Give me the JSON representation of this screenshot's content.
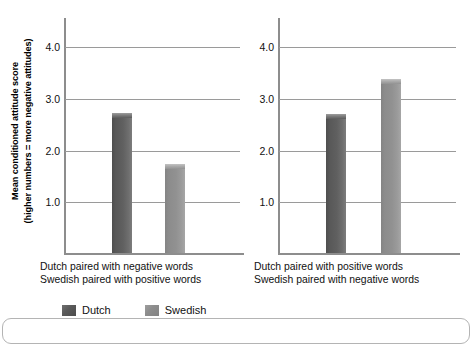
{
  "chart_data": {
    "type": "bar",
    "title": "",
    "subtitle": "",
    "xlabel": "",
    "ylabel": "Mean conditioned attitude score (higher numbers = more negative attitudes)",
    "ylabel_lines": [
      "Mean conditioned attitude score",
      "(higher numbers = more negative attitudes)"
    ],
    "ylim": [
      0,
      4.6
    ],
    "yticks": [
      1.0,
      2.0,
      3.0,
      4.0
    ],
    "ytick_labels": [
      "1.0",
      "2.0",
      "3.0",
      "4.0"
    ],
    "grid": true,
    "legend_position": "bottom",
    "categories": [
      "Dutch",
      "Swedish"
    ],
    "series": [
      {
        "name": "Dutch",
        "color": "#585858",
        "values": [
          2.75,
          2.73
        ]
      },
      {
        "name": "Swedish",
        "color": "#8d8d8d",
        "values": [
          1.75,
          3.4
        ]
      }
    ],
    "panels": [
      {
        "caption_lines": [
          "Dutch paired with negative words",
          "Swedish paired with positive words"
        ],
        "bars": [
          {
            "label": "Dutch",
            "value": 2.75,
            "series": "dutch"
          },
          {
            "label": "Swedish",
            "value": 1.75,
            "series": "swedish"
          }
        ]
      },
      {
        "caption_lines": [
          "Dutch paired with positive words",
          "Swedish paired with negative words"
        ],
        "bars": [
          {
            "label": "Dutch",
            "value": 2.73,
            "series": "dutch"
          },
          {
            "label": "Swedish",
            "value": 3.4,
            "series": "swedish"
          }
        ]
      }
    ]
  },
  "legend": {
    "items": [
      {
        "label": "Dutch",
        "swatch": "dutch",
        "color": "#585858"
      },
      {
        "label": "Swedish",
        "swatch": "swedish",
        "color": "#8d8d8d"
      }
    ]
  },
  "colors": {
    "dutch": "#585858",
    "swedish": "#8d8d8d",
    "axis": "#8d8d8d",
    "grid": "#9a9a9a",
    "frame": "#b4b4b4",
    "text": "#111111"
  }
}
